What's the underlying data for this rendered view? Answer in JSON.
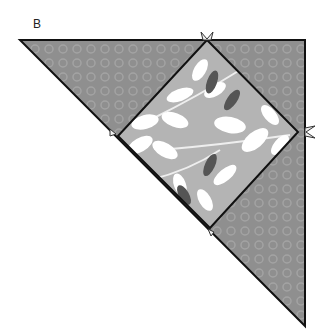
{
  "diagram": {
    "label": "B",
    "colors": {
      "triangle_fill": "#8f8f8f",
      "square_fill": "#b4b4b4",
      "leaf_white": "#ffffff",
      "leaf_dark": "#555555",
      "outline": "#111111"
    },
    "shapes": {
      "outer_triangle": [
        [
          20,
          40
        ],
        [
          305,
          40
        ],
        [
          305,
          326
        ]
      ],
      "center_square": [
        [
          207,
          40
        ],
        [
          298,
          132
        ],
        [
          210,
          228
        ],
        [
          118,
          136
        ]
      ]
    },
    "notch_marks": [
      {
        "name": "top-notch",
        "x": 207,
        "y": 37
      },
      {
        "name": "right-notch",
        "x": 308,
        "y": 132
      },
      {
        "name": "left-notch",
        "x": 112,
        "y": 133
      },
      {
        "name": "bottom-notch",
        "x": 210,
        "y": 232
      }
    ]
  }
}
